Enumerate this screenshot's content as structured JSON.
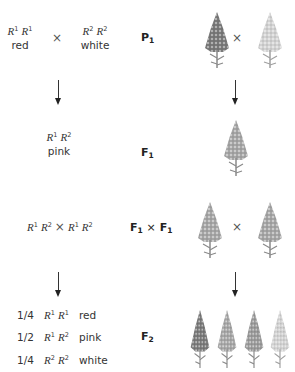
{
  "parents": {
    "left": {
      "allele1": "R",
      "sup1": "1",
      "allele2": "R",
      "sup2": "1",
      "phenotype": "red"
    },
    "cross_symbol": "×",
    "right": {
      "allele1": "R",
      "sup1": "2",
      "allele2": "R",
      "sup2": "2",
      "phenotype": "white"
    },
    "generation_label": {
      "letter": "P",
      "sub": "1"
    }
  },
  "f1": {
    "genotype": {
      "allele1": "R",
      "sup1": "1",
      "allele2": "R",
      "sup2": "2"
    },
    "phenotype": "pink",
    "generation_label": {
      "letter": "F",
      "sub": "1"
    }
  },
  "f1_cross": {
    "left": {
      "allele1": "R",
      "sup1": "1",
      "allele2": "R",
      "sup2": "2"
    },
    "cross_symbol": "×",
    "right": {
      "allele1": "R",
      "sup1": "1",
      "allele2": "R",
      "sup2": "2"
    },
    "generation_label": {
      "a_letter": "F",
      "a_sub": "1",
      "cross": "×",
      "b_letter": "F",
      "b_sub": "1"
    }
  },
  "f2": {
    "ratios": [
      {
        "fraction": "1/4",
        "allele1": "R",
        "sup1": "1",
        "allele2": "R",
        "sup2": "1",
        "phenotype": "red"
      },
      {
        "fraction": "1/2",
        "allele1": "R",
        "sup1": "1",
        "allele2": "R",
        "sup2": "2",
        "phenotype": "pink"
      },
      {
        "fraction": "1/4",
        "allele1": "R",
        "sup1": "2",
        "allele2": "R",
        "sup2": "2",
        "phenotype": "white"
      }
    ],
    "generation_label": {
      "letter": "F",
      "sub": "2"
    }
  },
  "plant_cross_symbol": "×",
  "colors": {
    "red_plant": "#7a7a7a",
    "pink_plant": "#a6a6a6",
    "white_plant": "#d2d2d2",
    "stem": "#8a8a8a"
  }
}
